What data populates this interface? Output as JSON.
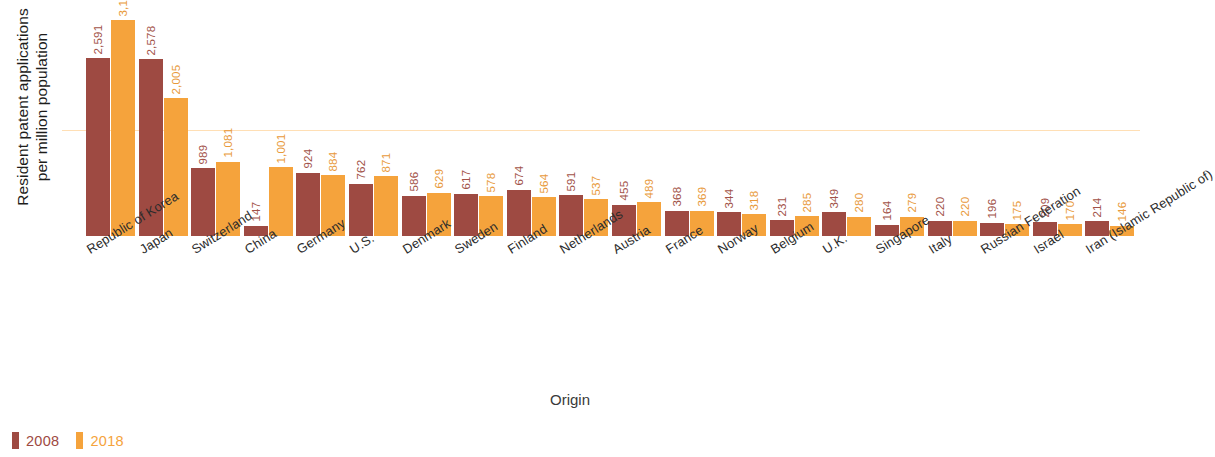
{
  "chart_data": {
    "type": "bar",
    "title": "",
    "xlabel": "Origin",
    "ylabel": "Resident patent applications\nper million population",
    "grid": false,
    "legend_position": "bottom-left",
    "ylim": [
      0,
      3148
    ],
    "categories": [
      "Republic of Korea",
      "Japan",
      "Switzerland",
      "China",
      "Germany",
      "U.S.",
      "Denmark",
      "Sweden",
      "Finland",
      "Netherlands",
      "Austria",
      "France",
      "Norway",
      "Belgium",
      "U.K.",
      "Singapore",
      "Italy",
      "Russian Federation",
      "Israel",
      "Iran (Islamic Republic of)"
    ],
    "series": [
      {
        "name": "2008",
        "color": "#9e4a42",
        "values": [
          2591,
          2578,
          989,
          147,
          924,
          762,
          586,
          617,
          674,
          591,
          455,
          368,
          344,
          231,
          349,
          164,
          220,
          196,
          209,
          214
        ],
        "labels": [
          "2,591",
          "2,578",
          "989",
          "147",
          "924",
          "762",
          "586",
          "617",
          "674",
          "591",
          "455",
          "368",
          "344",
          "231",
          "349",
          "164",
          "220",
          "196",
          "209",
          "214"
        ]
      },
      {
        "name": "2018",
        "color": "#f5a33c",
        "values": [
          3148,
          2005,
          1081,
          1001,
          884,
          871,
          629,
          578,
          564,
          537,
          489,
          369,
          318,
          285,
          280,
          279,
          220,
          175,
          170,
          146
        ],
        "labels": [
          "3,148",
          "2,005",
          "1,081",
          "1,001",
          "884",
          "871",
          "629",
          "578",
          "564",
          "537",
          "489",
          "369",
          "318",
          "285",
          "280",
          "279",
          "220",
          "175",
          "170",
          "146"
        ]
      }
    ]
  },
  "legend": {
    "items": [
      {
        "label": "2008",
        "color": "#9e4a42"
      },
      {
        "label": "2018",
        "color": "#f5a33c"
      }
    ]
  }
}
